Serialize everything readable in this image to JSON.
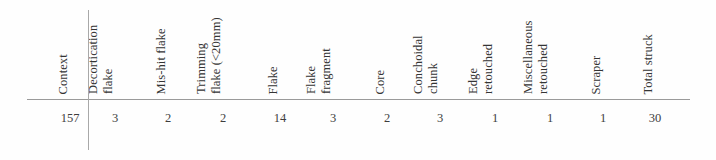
{
  "figure": {
    "kind": "data-table",
    "background_color": "#fefefe",
    "rule_color": "#9a9a9a",
    "text_color": "#343434"
  },
  "table": {
    "columns": [
      {
        "id": "context",
        "label_line1": "Context",
        "label_line2": "",
        "center_x": 70,
        "header_x": 70
      },
      {
        "id": "decortication-flake",
        "label_line1": "Decortication",
        "label_line2": "flake",
        "center_x": 115,
        "header_x": 115
      },
      {
        "id": "mis-hit-flake",
        "label_line1": "Mis-hit flake",
        "label_line2": "",
        "center_x": 168,
        "header_x": 168
      },
      {
        "id": "trimming-flake",
        "label_line1": "Trimming",
        "label_line2": "flake (<20mm)",
        "center_x": 223,
        "header_x": 223
      },
      {
        "id": "flake",
        "label_line1": "Flake",
        "label_line2": "",
        "center_x": 280,
        "header_x": 280
      },
      {
        "id": "flake-fragment",
        "label_line1": "Flake",
        "label_line2": "fragment",
        "center_x": 333,
        "header_x": 333
      },
      {
        "id": "core",
        "label_line1": "Core",
        "label_line2": "",
        "center_x": 387,
        "header_x": 387
      },
      {
        "id": "conchoidal-chunk",
        "label_line1": "Conchoidal",
        "label_line2": "chunk",
        "center_x": 440,
        "header_x": 440
      },
      {
        "id": "edge-retouched",
        "label_line1": "Edge",
        "label_line2": "retouched",
        "center_x": 495,
        "header_x": 495
      },
      {
        "id": "miscellaneous-retouched",
        "label_line1": "Miscellaneous",
        "label_line2": "retouched",
        "center_x": 550,
        "header_x": 550
      },
      {
        "id": "scraper",
        "label_line1": "Scraper",
        "label_line2": "",
        "center_x": 603,
        "header_x": 603
      },
      {
        "id": "total-struck",
        "label_line1": "Total struck",
        "label_line2": "",
        "center_x": 655,
        "header_x": 655
      }
    ],
    "rows": [
      {
        "context": "157",
        "values": [
          "3",
          "2",
          "2",
          "14",
          "3",
          "2",
          "3",
          "1",
          "1",
          "1",
          "30"
        ]
      }
    ]
  },
  "chart_data": {
    "type": "table",
    "title": "",
    "categories": [
      "Decortication flake",
      "Mis-hit flake",
      "Trimming flake (<20mm)",
      "Flake",
      "Flake fragment",
      "Core",
      "Conchoidal chunk",
      "Edge retouched",
      "Miscellaneous retouched",
      "Scraper",
      "Total struck"
    ],
    "series": [
      {
        "name": "Context 157",
        "values": [
          3,
          2,
          2,
          14,
          3,
          2,
          3,
          1,
          1,
          1,
          30
        ]
      }
    ],
    "xlabel": "Artefact category",
    "ylabel": "Count",
    "grid": false,
    "legend": "none"
  }
}
